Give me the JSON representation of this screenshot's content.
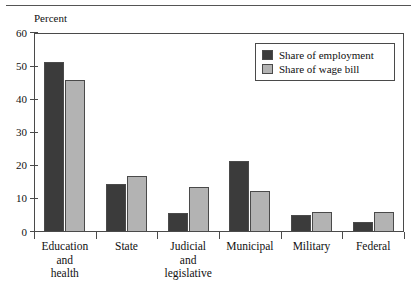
{
  "figure": {
    "unit_caption": "Percent"
  },
  "chart_data": {
    "type": "bar",
    "title": "",
    "subtitle": "",
    "xlabel": "",
    "ylabel": "Percent",
    "ylim": [
      0,
      60
    ],
    "yticks": [
      0,
      10,
      20,
      30,
      40,
      50,
      60
    ],
    "ytick_labels": [
      "0",
      "10",
      "20",
      "30",
      "40",
      "50",
      "60"
    ],
    "grid": false,
    "legend_position": "upper right",
    "categories": [
      "Education\nand\nhealth",
      "State",
      "Judicial\nand\nlegislative",
      "Municipal",
      "Military",
      "Federal"
    ],
    "series": [
      {
        "name": "Share of employment",
        "color": "#3b3b3b",
        "values": [
          51.2,
          14.4,
          5.7,
          21.4,
          5.0,
          3.1
        ]
      },
      {
        "name": "Share of wage bill",
        "color": "#b3b3b3",
        "values": [
          45.8,
          16.9,
          13.6,
          12.4,
          5.9,
          5.9
        ]
      }
    ]
  }
}
